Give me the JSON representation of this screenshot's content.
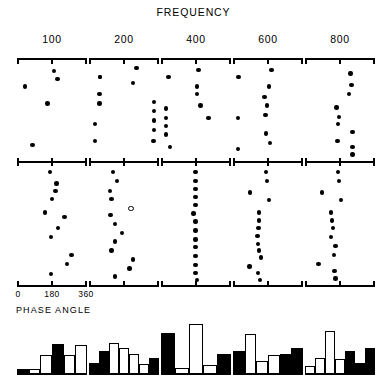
{
  "figure": {
    "title": "FREQUENCY",
    "x_axis_label": "PHASE ANGLE",
    "x_tick_labels": [
      "0",
      "180",
      "360"
    ],
    "frequencies": [
      "100",
      "200",
      "400",
      "600",
      "800"
    ]
  },
  "chart_data": {
    "type": "scatter",
    "title": "FREQUENCY",
    "xlabel": "PHASE ANGLE",
    "ylabel": "",
    "xlim": [
      0,
      360
    ],
    "grid": false,
    "legend": "none",
    "panel_columns": [
      "100",
      "200",
      "400",
      "600",
      "800"
    ],
    "panel_rows": [
      "upper",
      "lower"
    ],
    "panels": [
      {
        "frequency": "100",
        "upper": {
          "x": [
            28,
            190,
            210,
            155,
            70
          ],
          "y": [
            0.22,
            0.05,
            0.14,
            0.4,
            0.84
          ],
          "filled": [
            true,
            true,
            true,
            true,
            true
          ]
        },
        "lower": {
          "x": [
            168,
            205,
            200,
            180,
            140,
            250,
            215,
            175,
            290,
            265,
            175
          ],
          "y": [
            0.02,
            0.12,
            0.19,
            0.26,
            0.38,
            0.42,
            0.52,
            0.6,
            0.76,
            0.84,
            0.93
          ],
          "filled": [
            true,
            true,
            true,
            true,
            true,
            true,
            true,
            true,
            true,
            true,
            true
          ]
        }
      },
      {
        "frequency": "200",
        "upper": {
          "x": [
            45,
            45,
            42,
            42,
            18,
            18,
            250,
            230,
            348,
            348,
            348,
            348,
            345
          ],
          "y": [
            0.12,
            0.12,
            0.3,
            0.4,
            0.62,
            0.8,
            0.02,
            0.18,
            0.38,
            0.48,
            0.58,
            0.68,
            0.8
          ],
          "filled": [
            true,
            true,
            true,
            true,
            true,
            true,
            true,
            true,
            true,
            true,
            true,
            true,
            true
          ]
        },
        "lower": {
          "x": [
            118,
            140,
            100,
            110,
            215,
            105,
            130,
            168,
            128,
            110,
            230,
            210,
            130
          ],
          "y": [
            0.02,
            0.1,
            0.19,
            0.26,
            0.34,
            0.4,
            0.48,
            0.56,
            0.64,
            0.72,
            0.8,
            0.88,
            0.95
          ],
          "filled": [
            true,
            true,
            true,
            true,
            false,
            true,
            true,
            true,
            true,
            true,
            true,
            true,
            true
          ]
        }
      },
      {
        "frequency": "400",
        "upper": {
          "x": [
            25,
            10,
            10,
            10,
            10,
            35,
            195,
            185,
            185,
            205,
            250
          ],
          "y": [
            0.12,
            0.45,
            0.55,
            0.64,
            0.73,
            0.86,
            0.04,
            0.22,
            0.3,
            0.42,
            0.55
          ],
          "filled": [
            true,
            true,
            true,
            true,
            true,
            true,
            true,
            true,
            true,
            true,
            true
          ]
        },
        "lower": {
          "x": [
            178,
            178,
            178,
            178,
            178,
            165,
            178,
            178,
            178,
            178,
            178,
            178,
            178,
            185
          ],
          "y": [
            0.02,
            0.1,
            0.17,
            0.24,
            0.31,
            0.39,
            0.46,
            0.54,
            0.62,
            0.69,
            0.77,
            0.85,
            0.92,
            0.98
          ],
          "filled": [
            true,
            true,
            true,
            true,
            true,
            true,
            true,
            true,
            true,
            true,
            true,
            true,
            true,
            true
          ]
        }
      },
      {
        "frequency": "600",
        "upper": {
          "x": [
            15,
            12,
            12,
            200,
            185,
            160,
            175,
            165,
            170,
            190
          ],
          "y": [
            0.12,
            0.55,
            0.88,
            0.04,
            0.22,
            0.33,
            0.42,
            0.52,
            0.72,
            0.82
          ],
          "filled": [
            true,
            true,
            true,
            true,
            true,
            true,
            true,
            true,
            true,
            true
          ]
        },
        "lower": {
          "x": [
            170,
            175,
            80,
            185,
            130,
            128,
            126,
            120,
            122,
            128,
            140,
            75,
            125,
            135
          ],
          "y": [
            0.02,
            0.1,
            0.2,
            0.27,
            0.38,
            0.45,
            0.52,
            0.59,
            0.66,
            0.72,
            0.78,
            0.86,
            0.92,
            0.98
          ],
          "filled": [
            true,
            true,
            true,
            true,
            true,
            true,
            true,
            true,
            true,
            true,
            true,
            true,
            true,
            true
          ]
        }
      },
      {
        "frequency": "800",
        "upper": {
          "x": [
            240,
            245,
            230,
            160,
            175,
            170,
            250,
            165,
            250,
            250
          ],
          "y": [
            0.08,
            0.2,
            0.3,
            0.44,
            0.54,
            0.62,
            0.7,
            0.8,
            0.86,
            0.94
          ],
          "filled": [
            true,
            true,
            true,
            true,
            true,
            true,
            true,
            true,
            true,
            true
          ]
        },
        "lower": {
          "x": [
            170,
            175,
            80,
            185,
            130,
            135,
            140,
            128,
            155,
            145,
            60,
            150,
            155
          ],
          "y": [
            0.02,
            0.1,
            0.2,
            0.27,
            0.38,
            0.45,
            0.52,
            0.6,
            0.68,
            0.76,
            0.84,
            0.9,
            0.97
          ],
          "filled": [
            true,
            true,
            true,
            true,
            true,
            true,
            true,
            true,
            true,
            true,
            true,
            true,
            true
          ]
        }
      }
    ]
  },
  "histograms": {
    "type": "bar",
    "note": "alternating filled (black) and hollow (white) bars per frequency panel",
    "panels": [
      {
        "frequency": "100",
        "bins": 6,
        "values": [
          0.1,
          0.1,
          0.38,
          0.6,
          0.38,
          0.58
        ],
        "fills": [
          "filled",
          "hollow",
          "hollow",
          "filled",
          "hollow",
          "hollow"
        ]
      },
      {
        "frequency": "200",
        "bins": 6,
        "values": [
          0.22,
          0.46,
          0.62,
          0.52,
          0.4,
          0.2,
          0.32
        ],
        "fills": [
          "filled",
          "filled",
          "hollow",
          "hollow",
          "hollow",
          "hollow",
          "filled"
        ]
      },
      {
        "frequency": "400",
        "bins": 5,
        "values": [
          0.82,
          0.12,
          1.0,
          0.18,
          0.4
        ],
        "fills": [
          "filled",
          "hollow",
          "hollow",
          "hollow",
          "filled"
        ]
      },
      {
        "frequency": "600",
        "bins": 6,
        "values": [
          0.46,
          0.8,
          0.26,
          0.38,
          0.4,
          0.52
        ],
        "fills": [
          "filled",
          "hollow",
          "hollow",
          "hollow",
          "filled",
          "filled"
        ]
      },
      {
        "frequency": "800",
        "bins": 7,
        "values": [
          0.16,
          0.32,
          0.86,
          0.3,
          0.46,
          0.22,
          0.52
        ],
        "fills": [
          "hollow",
          "hollow",
          "hollow",
          "hollow",
          "filled",
          "filled",
          "filled"
        ]
      }
    ]
  }
}
